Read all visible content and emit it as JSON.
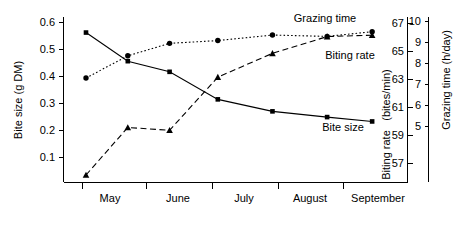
{
  "chart_data": {
    "type": "line",
    "title": "",
    "subtitle": "",
    "xlabel": "",
    "grid": false,
    "legend_position": "inline-annotations",
    "x_tick_labels": [
      "May",
      "June",
      "July",
      "August",
      "September"
    ],
    "x_axis_kind": "month-intervals",
    "axes": [
      {
        "id": "left",
        "label": "Bite size (g DM)",
        "ticks": [
          0.1,
          0.2,
          0.3,
          0.4,
          0.5,
          0.6
        ],
        "tick_labels": [
          "0.1",
          "0.2",
          "0.3",
          "0.4",
          "0.5",
          "0.6"
        ],
        "range": [
          0.03,
          0.635
        ],
        "side": "left"
      },
      {
        "id": "right-inner",
        "label": "Biting rate",
        "unit_label": "(bites/min)",
        "ticks": [
          57,
          59,
          61,
          63,
          65,
          67
        ],
        "tick_labels": [
          "57",
          "59",
          "61",
          "63",
          "65",
          "67"
        ],
        "range": [
          55.6,
          67.4
        ],
        "side": "right-inner"
      },
      {
        "id": "right-outer",
        "label": "Grazing time (h/day)",
        "ticks": [
          5,
          6,
          7,
          8,
          9,
          10
        ],
        "tick_labels": [
          "5",
          "6",
          "7",
          "8",
          "9",
          "10"
        ],
        "range": [
          4.3,
          10.25
        ],
        "side": "right-outer"
      }
    ],
    "series": [
      {
        "name": "Bite size",
        "axis": "left",
        "marker": "square",
        "linestyle": "solid",
        "label_text": "Bite size",
        "x": [
          0.35,
          1.0,
          1.65,
          2.4,
          3.25,
          4.1,
          4.8
        ],
        "values": [
          0.578,
          0.473,
          0.434,
          0.333,
          0.289,
          0.268,
          0.252
        ]
      },
      {
        "name": "Grazing time",
        "axis": "right-outer",
        "marker": "circle",
        "linestyle": "dotted",
        "label_text": "Grazing time",
        "x": [
          0.35,
          1.0,
          1.65,
          2.4,
          3.25,
          4.1,
          4.8
        ],
        "values": [
          8.05,
          8.85,
          9.3,
          9.4,
          9.6,
          9.55,
          9.72
        ]
      },
      {
        "name": "Biting rate",
        "axis": "right-inner",
        "marker": "triangle",
        "linestyle": "dashed",
        "label_text": "Biting rate",
        "x": [
          0.35,
          1.0,
          1.65,
          2.4,
          3.25,
          4.1,
          4.8
        ],
        "values": [
          56.1,
          59.5,
          59.3,
          63.1,
          64.8,
          66.0,
          66.1
        ]
      }
    ]
  }
}
